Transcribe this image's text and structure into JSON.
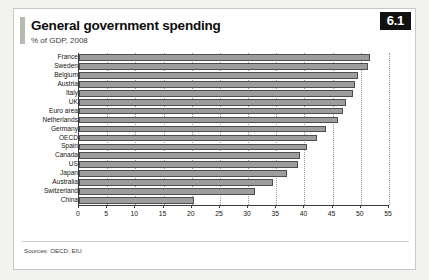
{
  "header": {
    "title": "General government spending",
    "subtitle": "% of GDP, 2008",
    "badge": "6.1"
  },
  "footer": {
    "source": "Sources: OECD; EIU"
  },
  "colors": {
    "bar_fill": "#9d9d9d",
    "bar_stroke": "#4d4d4d",
    "badge_bg": "#111111",
    "card_bg": "#ffffff",
    "page_bg": "#f2f2f0",
    "accent": "#b9b9b4"
  },
  "chart_data": {
    "type": "bar",
    "orientation": "horizontal",
    "title": "General government spending",
    "subtitle": "% of GDP, 2008",
    "xlabel": "",
    "ylabel": "",
    "xlim": [
      0,
      55
    ],
    "xticks": [
      0,
      5,
      10,
      15,
      20,
      25,
      30,
      35,
      40,
      45,
      50,
      55
    ],
    "grid": true,
    "grid_axis": "x",
    "legend": false,
    "categories": [
      "France",
      "Sweden",
      "Belgium",
      "Austria",
      "Italy",
      "UK",
      "Euro area",
      "Netherlands",
      "Germany",
      "OECD",
      "Spain",
      "Canada",
      "US",
      "Japan",
      "Australia",
      "Switzerland",
      "China"
    ],
    "values": [
      51.6,
      51.2,
      49.5,
      49.0,
      48.7,
      47.4,
      46.8,
      45.9,
      43.8,
      42.2,
      40.5,
      39.2,
      38.8,
      36.9,
      34.5,
      31.2,
      20.4
    ],
    "series": [
      {
        "name": "General government spending, % of GDP",
        "values": [
          51.6,
          51.2,
          49.5,
          49.0,
          48.7,
          47.4,
          46.8,
          45.9,
          43.8,
          42.2,
          40.5,
          39.2,
          38.8,
          36.9,
          34.5,
          31.2,
          20.4
        ]
      }
    ]
  }
}
